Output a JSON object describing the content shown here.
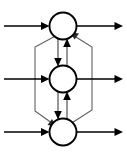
{
  "diagram": {
    "type": "node-graph",
    "canvas": {
      "width": 127,
      "height": 156,
      "background": "#ffffff"
    },
    "colors": {
      "node_stroke": "#000000",
      "node_fill": "#ffffff",
      "edge_primary": "#000000",
      "edge_secondary": "#5a5a5a",
      "arrowhead": "#000000"
    },
    "nodes": [
      {
        "id": "node-top",
        "label": "",
        "cx": 63,
        "cy": 26,
        "r": 13.5
      },
      {
        "id": "node-middle",
        "label": "",
        "cx": 63,
        "cy": 79,
        "r": 13.5
      },
      {
        "id": "node-bottom",
        "label": "",
        "cx": 63,
        "cy": 132,
        "r": 13.5
      }
    ],
    "external_inputs": [
      {
        "id": "input-top",
        "target": "node-top",
        "from_x": 4,
        "y": 26
      },
      {
        "id": "input-middle",
        "target": "node-middle",
        "from_x": 4,
        "y": 79
      },
      {
        "id": "input-bottom",
        "target": "node-bottom",
        "from_x": 4,
        "y": 132
      }
    ],
    "external_outputs": [
      {
        "id": "output-top",
        "source": "node-top",
        "to_x": 123,
        "y": 26
      },
      {
        "id": "output-middle",
        "source": "node-middle",
        "to_x": 123,
        "y": 79
      },
      {
        "id": "output-bottom",
        "source": "node-bottom",
        "to_x": 123,
        "y": 132
      }
    ],
    "internal_edges": [
      {
        "id": "edge-top-to-middle",
        "from": "node-top",
        "to": "node-middle",
        "direction": "down",
        "x": 58
      },
      {
        "id": "edge-middle-to-top",
        "from": "node-middle",
        "to": "node-top",
        "direction": "up",
        "x": 67
      },
      {
        "id": "edge-middle-to-bottom",
        "from": "node-middle",
        "to": "node-bottom",
        "direction": "down",
        "x": 58
      },
      {
        "id": "edge-bottom-to-middle",
        "from": "node-bottom",
        "to": "node-middle",
        "direction": "up",
        "x": 67
      }
    ],
    "bypass_edges": [
      {
        "id": "bypass-top-to-bottom",
        "from": "node-top",
        "to": "node-bottom",
        "side": "left",
        "rail_x": 35
      },
      {
        "id": "bypass-bottom-to-top",
        "from": "node-bottom",
        "to": "node-top",
        "side": "right",
        "rail_x": 92
      }
    ]
  }
}
